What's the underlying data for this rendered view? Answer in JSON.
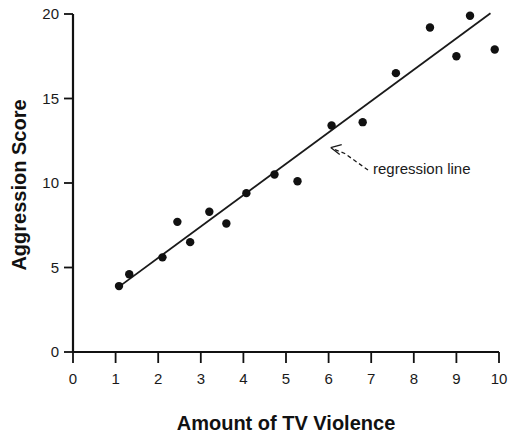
{
  "chart_data": {
    "type": "scatter",
    "title": "",
    "xlabel": "Amount of TV Violence",
    "ylabel": "Aggression Score",
    "xlim": [
      0,
      10
    ],
    "ylim": [
      0,
      20
    ],
    "xticks": [
      "0",
      "1",
      "2",
      "3",
      "4",
      "5",
      "6",
      "7",
      "8",
      "9",
      "10"
    ],
    "yticks": [
      "0",
      "5",
      "10",
      "15",
      "20"
    ],
    "grid": false,
    "legend": "none",
    "series": [
      {
        "name": "observations",
        "points": [
          [
            1.08,
            3.9
          ],
          [
            1.32,
            4.6
          ],
          [
            2.1,
            5.6
          ],
          [
            2.45,
            7.7
          ],
          [
            2.75,
            6.5
          ],
          [
            3.2,
            8.3
          ],
          [
            3.6,
            7.6
          ],
          [
            4.07,
            9.4
          ],
          [
            4.73,
            10.5
          ],
          [
            5.27,
            10.1
          ],
          [
            6.07,
            13.4
          ],
          [
            6.8,
            13.6
          ],
          [
            7.58,
            16.5
          ],
          [
            8.38,
            19.2
          ],
          [
            9.0,
            17.5
          ],
          [
            9.32,
            19.9
          ],
          [
            9.9,
            17.9
          ]
        ]
      }
    ],
    "regression_line": {
      "label": "regression line",
      "x_start": 1.02,
      "y_start": 3.75,
      "x_end": 9.8,
      "y_end": 20.05
    },
    "annotation": {
      "text": "regression line",
      "target_x": 6.05,
      "target_y": 12.1
    },
    "colors": {
      "axis": "#111111",
      "point": "#111111",
      "line": "#1a1a1a",
      "background": "#ffffff"
    }
  }
}
